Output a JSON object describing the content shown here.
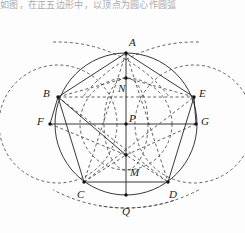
{
  "page": {
    "width": 245,
    "height": 233,
    "background": "#fdfdfd",
    "top_text": "如图，在正五边形中，以顶点为圆心作圆弧"
  },
  "figure": {
    "stroke_solid": "#222222",
    "stroke_dashed": "#3a3a3a",
    "point_color": "#111111",
    "solid_width": 0.9,
    "dashed_width": 0.8,
    "dash_pattern": "3,2.6"
  },
  "points": [
    {
      "id": "A",
      "label": "A",
      "x": 126,
      "y": 53,
      "lx": 129,
      "ly": 37
    },
    {
      "id": "B",
      "label": "B",
      "x": 58,
      "y": 97,
      "lx": 43,
      "ly": 88
    },
    {
      "id": "C",
      "label": "C",
      "x": 84,
      "y": 182,
      "lx": 77,
      "ly": 189
    },
    {
      "id": "D",
      "label": "D",
      "x": 168,
      "y": 182,
      "lx": 169,
      "ly": 189
    },
    {
      "id": "E",
      "label": "E",
      "x": 194,
      "y": 97,
      "lx": 199,
      "ly": 88
    },
    {
      "id": "F",
      "label": "F",
      "x": 50,
      "y": 124,
      "lx": 37,
      "ly": 116
    },
    {
      "id": "G",
      "label": "G",
      "x": 196,
      "y": 124,
      "lx": 201,
      "ly": 116
    },
    {
      "id": "N",
      "label": "N",
      "x": 126,
      "y": 78,
      "lx": 118,
      "ly": 83
    },
    {
      "id": "P",
      "label": "P",
      "x": 126,
      "y": 124,
      "lx": 129,
      "ly": 113
    },
    {
      "id": "M",
      "label": "M",
      "x": 126,
      "y": 155,
      "lx": 130,
      "ly": 167
    },
    {
      "id": "Q",
      "label": "Q",
      "x": 126,
      "y": 195,
      "lx": 122,
      "ly": 206
    }
  ],
  "circles": [
    {
      "name": "circumcircle",
      "cx": 126,
      "cy": 124,
      "r": 71,
      "style": "solid"
    },
    {
      "name": "inner-dashed-circle",
      "cx": 126,
      "cy": 124,
      "r": 46,
      "style": "dashed"
    },
    {
      "name": "small-ellipse-axis",
      "cx": 126,
      "cy": 124,
      "rx": 22,
      "ry": 46,
      "style": "dashed"
    },
    {
      "name": "arc-circle-left",
      "cx": 58,
      "cy": 124,
      "r": 59,
      "style": "dashed"
    },
    {
      "name": "arc-circle-right",
      "cx": 194,
      "cy": 124,
      "r": 59,
      "style": "dashed"
    }
  ],
  "arcs": [
    {
      "name": "arc-top-left",
      "cx": 58,
      "cy": 182,
      "r": 140,
      "start_deg": 268,
      "end_deg": 322,
      "style": "dashed"
    },
    {
      "name": "arc-top-right",
      "cx": 194,
      "cy": 182,
      "r": 140,
      "start_deg": 218,
      "end_deg": 272,
      "style": "dashed"
    },
    {
      "name": "arc-low-left",
      "cx": 126,
      "cy": 53,
      "r": 155,
      "start_deg": 72,
      "end_deg": 118,
      "style": "dashed"
    },
    {
      "name": "arc-low-right",
      "cx": 126,
      "cy": 53,
      "r": 155,
      "start_deg": 62,
      "end_deg": 100,
      "style": "dashed"
    }
  ],
  "segments": [
    {
      "name": "side-AB",
      "from": "A",
      "to": "B",
      "style": "solid"
    },
    {
      "name": "side-BC",
      "from": "B",
      "to": "C",
      "style": "solid"
    },
    {
      "name": "side-CD",
      "from": "C",
      "to": "D",
      "style": "solid"
    },
    {
      "name": "side-DE",
      "from": "D",
      "to": "E",
      "style": "solid"
    },
    {
      "name": "side-EA",
      "from": "E",
      "to": "A",
      "style": "solid"
    },
    {
      "name": "chord-FG",
      "from": "F",
      "to": "G",
      "style": "solid"
    },
    {
      "name": "axis-AQ",
      "from": "A",
      "to": "Q",
      "style": "solid"
    },
    {
      "name": "diag-BE",
      "from": "B",
      "to": "E",
      "style": "dashed"
    },
    {
      "name": "diag-BD",
      "from": "B",
      "to": "D",
      "style": "dashed"
    },
    {
      "name": "diag-CE",
      "from": "C",
      "to": "E",
      "style": "dashed"
    },
    {
      "name": "diag-AC",
      "from": "A",
      "to": "C",
      "style": "dashed"
    },
    {
      "name": "diag-AD",
      "from": "A",
      "to": "D",
      "style": "dashed"
    },
    {
      "name": "seg-BF",
      "from": "B",
      "to": "F",
      "style": "solid"
    },
    {
      "name": "seg-EG",
      "from": "E",
      "to": "G",
      "style": "solid"
    },
    {
      "name": "seg-FM",
      "from": "F",
      "to": "M",
      "style": "dashed"
    },
    {
      "name": "seg-GM",
      "from": "G",
      "to": "M",
      "style": "dashed"
    },
    {
      "name": "seg-CM",
      "from": "C",
      "to": "M",
      "style": "dashed"
    },
    {
      "name": "seg-DM",
      "from": "D",
      "to": "M",
      "style": "dashed"
    },
    {
      "name": "seg-BM",
      "from": "B",
      "to": "M",
      "style": "solid"
    },
    {
      "name": "seg-NB",
      "from": "N",
      "to": "B",
      "style": "dashed"
    },
    {
      "name": "seg-NE",
      "from": "N",
      "to": "E",
      "style": "dashed"
    }
  ]
}
